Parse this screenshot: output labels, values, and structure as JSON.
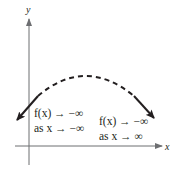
{
  "diagram": {
    "axes": {
      "x_label": "x",
      "y_label": "y"
    },
    "annotations": {
      "left": {
        "line1": "f(x) → −∞",
        "line2": "as x → −∞"
      },
      "right": {
        "line1": "f(x) → −∞",
        "line2": "as x → ∞"
      }
    },
    "colors": {
      "ink": "#231f20",
      "axis": "#6d6e71",
      "background": "#ffffff"
    },
    "curve": {
      "shape": "downward-opening parabola",
      "left_end_behavior": "falls",
      "right_end_behavior": "falls",
      "middle_style": "dashed"
    }
  }
}
